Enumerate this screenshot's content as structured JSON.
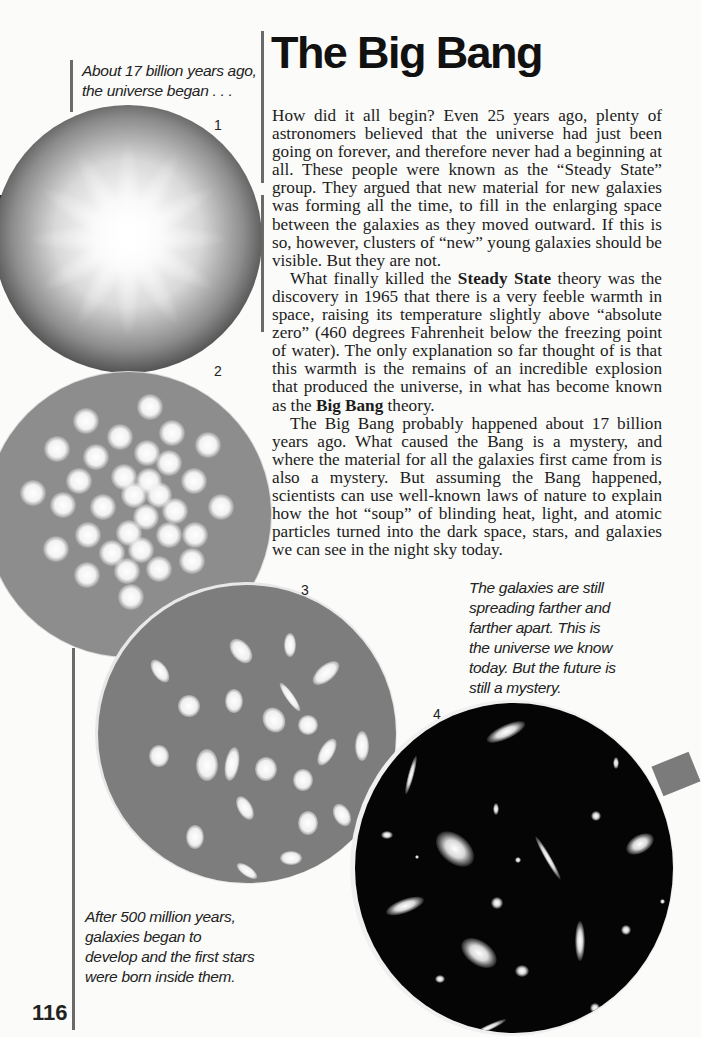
{
  "page": {
    "number": "116",
    "title": "The Big Bang"
  },
  "captions": {
    "top_left": "About 17 billion years ago, the universe began . . .",
    "right_middle": "The galaxies are still spreading farther and farther apart. This is the universe we know today. But the future is still a mystery.",
    "bottom_left": "After 500 million years, galaxies began to develop and the first stars were born inside them."
  },
  "figures": [
    {
      "number": "1",
      "description": "Bright glowing burst of the early universe"
    },
    {
      "number": "2",
      "description": "Glowing clumps of matter forming"
    },
    {
      "number": "3",
      "description": "Young galaxies developing"
    },
    {
      "number": "4",
      "description": "Galaxies spread apart in dark space"
    }
  ],
  "body": {
    "p1": "How did it all begin? Even 25 years ago, plenty of astronomers believed that the universe had just been going on forever, and therefore never had a beginning at all. These people were known as the “Steady State” group. They argued that new material for new galaxies was forming all the time, to fill in the enlarging space between the galaxies as they moved outward. If this is so, however, clusters of “new” young galaxies should be visible. But they are not.",
    "p2_pre": "What finally killed the ",
    "p2_bold": "Steady State",
    "p2_post": " theory was the discovery in 1965 that there is a very feeble warmth in space, raising its temperature slightly above “absolute zero” (460 degrees Fahrenheit below the freezing point of water). The only explanation so far thought of is that this warmth is the remains of an incredible explosion that produced the universe, in what has become known as the ",
    "p2_bold2": "Big Bang",
    "p2_end": " theory.",
    "p3": "The Big Bang probably happened about 17 billion years ago. What caused the Bang is a mystery, and where the material for all the galaxies first came from is also a mystery. But assuming the Bang happened, scientists can use well-known laws of nature to explain how the hot “soup” of blinding heat, light, and atomic particles turned into the dark space, stars, and galaxies we can see in the night sky today."
  }
}
